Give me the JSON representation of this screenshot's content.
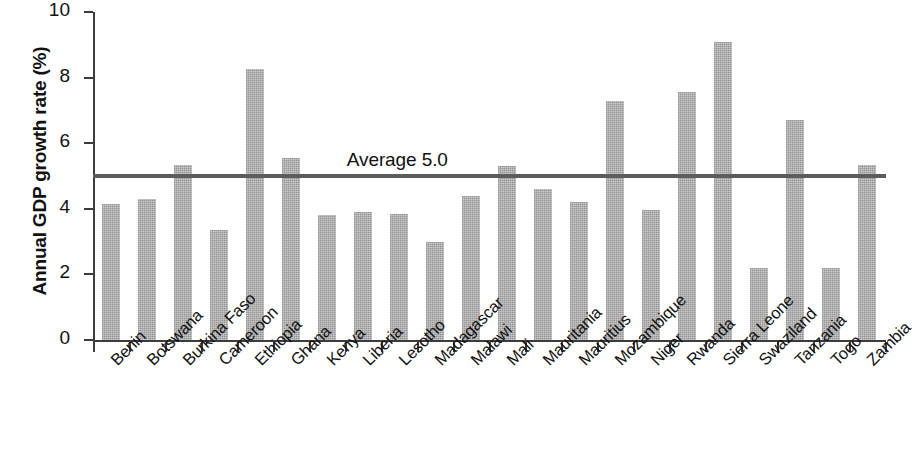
{
  "chart_data": {
    "type": "bar",
    "title": "",
    "xlabel": "",
    "ylabel": "Annual GDP growth rate (%)",
    "ylim": [
      0,
      10
    ],
    "yticks": [
      0,
      2,
      4,
      6,
      8,
      10
    ],
    "ytick_labels": [
      "0",
      "2",
      "4",
      "6",
      "8",
      "10"
    ],
    "grid": false,
    "legend": "none",
    "bar_color": "#a8a8a8",
    "axis_color": "#3c3c3c",
    "reference_line": {
      "label": "Average 5.0",
      "value": 5.0,
      "color": "#5c5c5c"
    },
    "categories": [
      "Benin",
      "Botswana",
      "Burkina Faso",
      "Cameroon",
      "Ethiopia",
      "Ghana",
      "Kenya",
      "Liberia",
      "Lesotho",
      "Madagascar",
      "Malawi",
      "Mali",
      "Mauritania",
      "Mauritius",
      "Mozambique",
      "Niger",
      "Rwanda",
      "Sierra Leone",
      "Swaziland",
      "Tanzania",
      "Togo",
      "Zambia"
    ],
    "values": [
      4.15,
      4.3,
      5.35,
      3.35,
      8.25,
      5.55,
      3.8,
      3.9,
      3.85,
      3.0,
      4.4,
      5.3,
      4.6,
      4.2,
      7.3,
      3.95,
      7.55,
      9.1,
      2.2,
      6.7,
      2.2,
      5.35
    ]
  }
}
